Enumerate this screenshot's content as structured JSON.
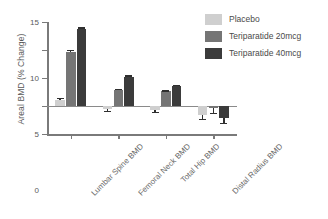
{
  "chart_data": {
    "type": "bar",
    "title": "",
    "xlabel": "",
    "ylabel": "Areal BMD (% Change)",
    "ylim": [
      -5,
      15
    ],
    "yticks": [
      -5,
      0,
      5,
      10,
      15
    ],
    "ytick_labels": [
      "-5",
      "0",
      "5",
      "10",
      "15"
    ],
    "grid": false,
    "legend_position": "top-right",
    "categories": [
      "Lumbar Spine BMD",
      "Femoral Neck BMD",
      "Total Hip BMD",
      "Distal Radius BMD"
    ],
    "series": [
      {
        "name": "Placebo",
        "color": "#cfcfcf",
        "values": [
          1.1,
          -0.6,
          -0.7,
          -1.6
        ],
        "errors": [
          0.3,
          0.3,
          0.3,
          0.7
        ]
      },
      {
        "name": "Teriparatide 20mcg",
        "color": "#757575",
        "values": [
          9.7,
          2.8,
          2.6,
          -0.4
        ],
        "errors": [
          0.25,
          0.2,
          0.2,
          0.9
        ]
      },
      {
        "name": "Teriparatide 40mcg",
        "color": "#3b3b3b",
        "values": [
          13.7,
          5.2,
          3.6,
          -2.1
        ],
        "errors": [
          0.35,
          0.25,
          0.2,
          0.9
        ]
      }
    ]
  },
  "legend": {
    "items": [
      {
        "label": "Placebo",
        "color": "#cfcfcf"
      },
      {
        "label": "Teriparatide 20mcg",
        "color": "#757575"
      },
      {
        "label": "Teriparatide 40mcg",
        "color": "#3b3b3b"
      }
    ]
  },
  "axes": {
    "y_title": "Areal BMD (% Change)"
  }
}
